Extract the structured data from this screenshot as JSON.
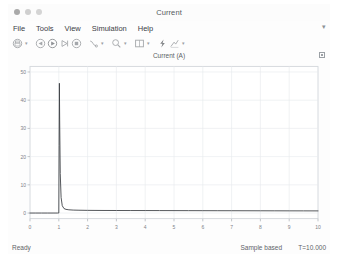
{
  "window": {
    "title": "Current",
    "traffic_lights": [
      "close",
      "minimize",
      "maximize"
    ]
  },
  "menu": {
    "items": [
      {
        "label": "File"
      },
      {
        "label": "Tools"
      },
      {
        "label": "View"
      },
      {
        "label": "Simulation"
      },
      {
        "label": "Help"
      }
    ],
    "overflow_label": "▾"
  },
  "toolbar": {
    "buttons": [
      {
        "name": "print-icon",
        "caret": true
      },
      {
        "name": "run-back-icon",
        "caret": false
      },
      {
        "name": "run-icon",
        "caret": false
      },
      {
        "name": "step-forward-icon",
        "caret": false
      },
      {
        "name": "stop-icon",
        "caret": false
      },
      {
        "name": "data-cursor-icon",
        "caret": true
      },
      {
        "name": "zoom-icon",
        "caret": true
      },
      {
        "name": "layout-icon",
        "caret": true
      },
      {
        "name": "highlight-signal-icon",
        "caret": false
      },
      {
        "name": "measurements-icon",
        "caret": true
      }
    ]
  },
  "plot": {
    "title": "Current (A)",
    "corner_badge_name": "axes-maximize-badge"
  },
  "status": {
    "ready_label": "Ready",
    "mode_label": "Sample based",
    "time_label": "T=10.000"
  },
  "chart_data": {
    "type": "line",
    "title": "Current (A)",
    "xlabel": "",
    "ylabel": "",
    "xlim": [
      0,
      10
    ],
    "ylim": [
      -2,
      52
    ],
    "grid": true,
    "legend": "none",
    "line_color": "#3b3f44",
    "xticks": [
      0,
      1,
      2,
      3,
      4,
      5,
      6,
      7,
      8,
      9,
      10
    ],
    "yticks": [
      0,
      10,
      20,
      30,
      40,
      50
    ],
    "series": [
      {
        "name": "Current (A)",
        "x": [
          0.0,
          0.2,
          0.4,
          0.6,
          0.8,
          0.9,
          0.95,
          0.98,
          1.0,
          1.01,
          1.02,
          1.03,
          1.05,
          1.08,
          1.12,
          1.18,
          1.25,
          1.35,
          1.5,
          1.7,
          2.0,
          2.5,
          3.0,
          3.5,
          4.0,
          4.5,
          5.0,
          5.5,
          6.0,
          6.5,
          7.0,
          7.5,
          8.0,
          8.5,
          9.0,
          9.5,
          10.0
        ],
        "y": [
          0.0,
          0.0,
          0.0,
          0.0,
          0.0,
          0.0,
          0.0,
          0.0,
          0.0,
          24.0,
          46.0,
          33.0,
          14.0,
          5.5,
          2.6,
          1.6,
          1.3,
          1.15,
          1.05,
          1.0,
          0.95,
          0.92,
          0.9,
          0.89,
          0.88,
          0.87,
          0.86,
          0.85,
          0.84,
          0.83,
          0.82,
          0.81,
          0.8,
          0.79,
          0.78,
          0.77,
          0.76
        ]
      }
    ],
    "peak": {
      "x": 1.02,
      "y": 46.0
    }
  }
}
